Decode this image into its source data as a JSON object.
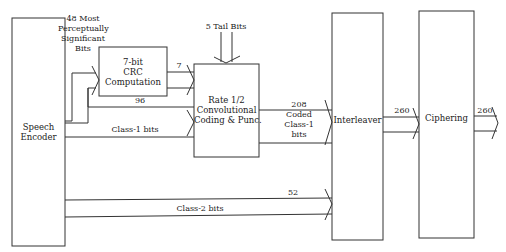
{
  "diagram": {
    "type": "block-diagram",
    "blocks": {
      "speech_encoder": {
        "label_line1": "Speech",
        "label_line2": "Encoder"
      },
      "crc": {
        "label_line1": "7-bit",
        "label_line2": "CRC",
        "label_line3": "Computation"
      },
      "conv": {
        "label_line1": "Rate 1/2",
        "label_line2": "Convolutional",
        "label_line3": "Coding & Punc."
      },
      "interleaver": {
        "label": "Interleaver"
      },
      "ciphering": {
        "label": "Ciphering"
      }
    },
    "edges": {
      "most_significant": {
        "line1": "48 Most",
        "line2": "Perceptually",
        "line3": "Significant",
        "line4": "Bits"
      },
      "crc_out": {
        "count": "7"
      },
      "tail_bits": {
        "label": "5 Tail Bits"
      },
      "class1": {
        "count": "96",
        "label": "Class-1 bits"
      },
      "coded": {
        "count": "208",
        "line1": "Coded",
        "line2": "Class-1",
        "line3": "bits"
      },
      "class2": {
        "count": "52",
        "label": "Class-2 bits"
      },
      "interleaver_out": {
        "count": "260"
      },
      "ciphering_out": {
        "count": "260"
      }
    },
    "colors": {
      "stroke": "#333333",
      "background": "#ffffff"
    }
  }
}
